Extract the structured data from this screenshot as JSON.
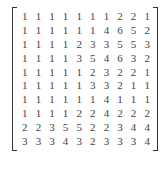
{
  "matrix": {
    "rows": [
      [
        1,
        1,
        1,
        1,
        1,
        1,
        1,
        2,
        2,
        1
      ],
      [
        1,
        1,
        1,
        1,
        1,
        1,
        4,
        6,
        5,
        2
      ],
      [
        1,
        1,
        1,
        1,
        2,
        3,
        3,
        5,
        5,
        3
      ],
      [
        1,
        1,
        1,
        1,
        3,
        5,
        4,
        6,
        3,
        2
      ],
      [
        1,
        1,
        1,
        1,
        1,
        2,
        3,
        2,
        2,
        1
      ],
      [
        1,
        1,
        1,
        1,
        1,
        3,
        3,
        2,
        1,
        1
      ],
      [
        1,
        1,
        1,
        1,
        1,
        1,
        4,
        1,
        1,
        1
      ],
      [
        1,
        1,
        1,
        1,
        2,
        2,
        4,
        2,
        2,
        2
      ],
      [
        2,
        2,
        3,
        5,
        5,
        2,
        2,
        3,
        4,
        4
      ],
      [
        3,
        3,
        3,
        4,
        3,
        2,
        3,
        3,
        3,
        4
      ]
    ]
  }
}
